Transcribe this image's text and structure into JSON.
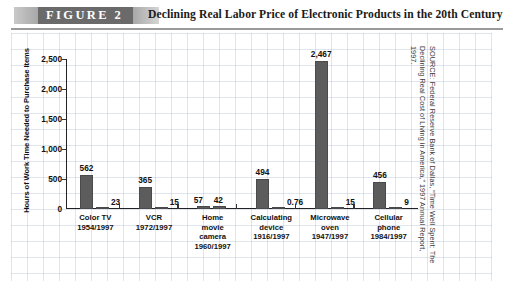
{
  "figure": {
    "tag": "FIGURE  2",
    "title": "Declining Real Labor Price of Electronic Products in the 20th Century",
    "source": "SOURCE: Federal Reserve Bank of Dallas, “Time Well Spent: The Declining Real Cost of Living in America,” 1997 Annual Report, 1997."
  },
  "chart_data": {
    "type": "bar",
    "title": "Declining Real Labor Price of Electronic Products in the 20th Century",
    "xlabel": "",
    "ylabel": "Hours of Work Time Needed to Purchase Items",
    "ylim": [
      0,
      2500
    ],
    "ytick_labels": [
      "0",
      "500",
      "1,000",
      "1,500",
      "2,000",
      "2,500"
    ],
    "ytick_values": [
      0,
      500,
      1000,
      1500,
      2000,
      2500
    ],
    "grid": false,
    "legend": "none",
    "categories": [
      "Color TV",
      "VCR",
      "Home movie camera",
      "Calculating device",
      "Microwave oven",
      "Cellular phone"
    ],
    "series": [
      {
        "name": "Earlier year",
        "values": [
          562,
          365,
          57,
          494,
          2467,
          456
        ],
        "value_labels": [
          "562",
          "365",
          "57",
          "494",
          "2,467",
          "456"
        ]
      },
      {
        "name": "1997",
        "values": [
          23,
          15,
          42,
          0.76,
          15,
          9
        ],
        "value_labels": [
          "23",
          "15",
          "42",
          "0.76",
          "15",
          "9"
        ]
      }
    ],
    "groups": [
      {
        "label_lines": [
          "Color TV",
          "1954/1997"
        ],
        "years": "1954/1997",
        "bars": [
          {
            "value": 562,
            "label": "562"
          },
          {
            "value": 23,
            "label": "23"
          }
        ]
      },
      {
        "label_lines": [
          "VCR",
          "1972/1997"
        ],
        "years": "1972/1997",
        "bars": [
          {
            "value": 365,
            "label": "365"
          },
          {
            "value": 15,
            "label": "15"
          }
        ]
      },
      {
        "label_lines": [
          "Home",
          "movie",
          "camera",
          "1960/1997"
        ],
        "years": "1960/1997",
        "bars": [
          {
            "value": 57,
            "label": "57"
          },
          {
            "value": 42,
            "label": "42"
          }
        ]
      },
      {
        "label_lines": [
          "Calculating",
          "device",
          "1916/1997"
        ],
        "years": "1916/1997",
        "bars": [
          {
            "value": 494,
            "label": "494"
          },
          {
            "value": 0.76,
            "label": "0.76"
          }
        ]
      },
      {
        "label_lines": [
          "Microwave",
          "oven",
          "1947/1997"
        ],
        "years": "1947/1997",
        "bars": [
          {
            "value": 2467,
            "label": "2,467"
          },
          {
            "value": 15,
            "label": "15"
          }
        ]
      },
      {
        "label_lines": [
          "Cellular",
          "phone",
          "1984/1997"
        ],
        "years": "1984/1997",
        "bars": [
          {
            "value": 456,
            "label": "456"
          },
          {
            "value": 9,
            "label": "9"
          }
        ]
      }
    ],
    "colors": {
      "bar": "#5c5c5c",
      "axis": "#222222",
      "text": "#111111",
      "header_tag_bg": "#6a6a6a",
      "grid_paper": "#96aac8"
    }
  }
}
